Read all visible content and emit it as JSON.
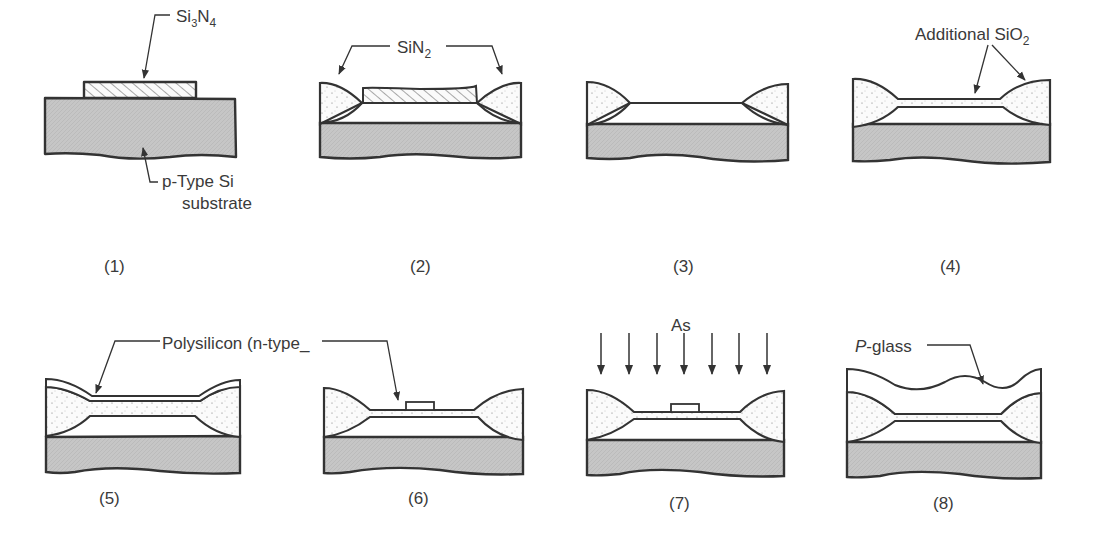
{
  "figure": {
    "type": "process-flow-diagram",
    "panels": [
      {
        "id": 1,
        "caption": "(1)",
        "labels": [
          "Si3N4",
          "p-Type Si substrate"
        ]
      },
      {
        "id": 2,
        "caption": "(2)",
        "labels": [
          "SiN2"
        ]
      },
      {
        "id": 3,
        "caption": "(3)",
        "labels": []
      },
      {
        "id": 4,
        "caption": "(4)",
        "labels": [
          "Additional SiO2"
        ]
      },
      {
        "id": 5,
        "caption": "(5)",
        "labels": [
          "Polysilicon (n-type_"
        ]
      },
      {
        "id": 6,
        "caption": "(6)",
        "labels": [
          "Polysilicon (n-type_"
        ]
      },
      {
        "id": 7,
        "caption": "(7)",
        "labels": [
          "As"
        ]
      },
      {
        "id": 8,
        "caption": "(8)",
        "labels": [
          "P-glass"
        ]
      }
    ]
  },
  "labels": {
    "si3n4_main": "Si",
    "si3n4_sub1": "3",
    "si3n4_n": "N",
    "si3n4_sub2": "4",
    "substrate_line1": "p-Type Si",
    "substrate_line2": "substrate",
    "sin2_main": "SiN",
    "sin2_sub": "2",
    "add_sio2_main": "Additional SiO",
    "add_sio2_sub": "2",
    "polysilicon": "Polysilicon (n-type_",
    "as": "As",
    "pglass_italic": "P",
    "pglass_rest": "-glass"
  },
  "captions": {
    "c1": "(1)",
    "c2": "(2)",
    "c3": "(3)",
    "c4": "(4)",
    "c5": "(5)",
    "c6": "(6)",
    "c7": "(7)",
    "c8": "(8)"
  },
  "colors": {
    "substrate": "#c8c8c8",
    "outline": "#333333",
    "oxide": "#ffffff",
    "text": "#3a3a3a"
  }
}
